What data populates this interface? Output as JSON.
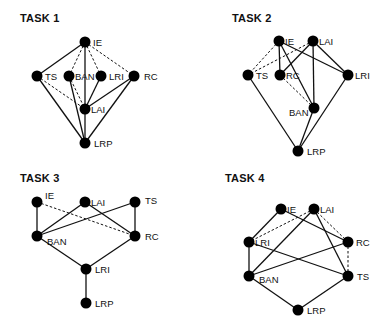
{
  "panels": [
    {
      "title": "TASK 1",
      "title_pos": [
        20,
        18
      ],
      "nodes": [
        {
          "id": "IE",
          "x": 85,
          "y": 42,
          "label": "IE",
          "lx": 8,
          "ly": 4
        },
        {
          "id": "TS",
          "x": 37,
          "y": 76,
          "label": "TS",
          "lx": 8,
          "ly": 4
        },
        {
          "id": "BAN",
          "x": 69,
          "y": 76,
          "label": "BAN",
          "lx": 6,
          "ly": 4
        },
        {
          "id": "LRI",
          "x": 101,
          "y": 76,
          "label": "LRI",
          "lx": 8,
          "ly": 4
        },
        {
          "id": "RC",
          "x": 134,
          "y": 76,
          "label": "RC",
          "lx": 10,
          "ly": 4
        },
        {
          "id": "LAI",
          "x": 85,
          "y": 109,
          "label": "LAI",
          "lx": 6,
          "ly": 4
        },
        {
          "id": "LRP",
          "x": 85,
          "y": 143,
          "label": "LRP",
          "lx": 9,
          "ly": 4
        }
      ],
      "edges": [
        {
          "from": "IE",
          "to": "TS",
          "style": "solid"
        },
        {
          "from": "IE",
          "to": "BAN",
          "style": "dashed"
        },
        {
          "from": "IE",
          "to": "LRI",
          "style": "dashed"
        },
        {
          "from": "IE",
          "to": "RC",
          "style": "dashed"
        },
        {
          "from": "IE",
          "to": "LAI",
          "style": "solid"
        },
        {
          "from": "TS",
          "to": "LAI",
          "style": "dashed"
        },
        {
          "from": "TS",
          "to": "LRP",
          "style": "solid"
        },
        {
          "from": "BAN",
          "to": "LAI",
          "style": "dashed"
        },
        {
          "from": "BAN",
          "to": "LRP",
          "style": "solid"
        },
        {
          "from": "LRI",
          "to": "LAI",
          "style": "solid"
        },
        {
          "from": "RC",
          "to": "LAI",
          "style": "solid"
        },
        {
          "from": "RC",
          "to": "LRP",
          "style": "solid"
        },
        {
          "from": "LAI",
          "to": "LRP",
          "style": "solid"
        }
      ]
    },
    {
      "title": "TASK 2",
      "title_pos": [
        232,
        18
      ],
      "nodes": [
        {
          "id": "IE",
          "x": 279,
          "y": 41,
          "label": "IE",
          "lx": 6,
          "ly": 4
        },
        {
          "id": "LAI",
          "x": 313,
          "y": 41,
          "label": "LAI",
          "lx": 6,
          "ly": 4
        },
        {
          "id": "TS",
          "x": 248,
          "y": 75,
          "label": "TS",
          "lx": 8,
          "ly": 4
        },
        {
          "id": "RC",
          "x": 280,
          "y": 75,
          "label": "RC",
          "lx": 6,
          "ly": 4
        },
        {
          "id": "LRI",
          "x": 348,
          "y": 75,
          "label": "LRI",
          "lx": 7,
          "ly": 4
        },
        {
          "id": "BAN",
          "x": 314,
          "y": 108,
          "label": "BAN",
          "lx": -25,
          "ly": 8
        },
        {
          "id": "LRP",
          "x": 298,
          "y": 151,
          "label": "LRP",
          "lx": 9,
          "ly": 4
        }
      ],
      "edges": [
        {
          "from": "IE",
          "to": "TS",
          "style": "dashed"
        },
        {
          "from": "LAI",
          "to": "TS",
          "style": "dashed"
        },
        {
          "from": "IE",
          "to": "RC",
          "style": "solid"
        },
        {
          "from": "IE",
          "to": "BAN",
          "style": "solid"
        },
        {
          "from": "IE",
          "to": "LRI",
          "style": "solid"
        },
        {
          "from": "LAI",
          "to": "RC",
          "style": "solid"
        },
        {
          "from": "LAI",
          "to": "LRI",
          "style": "solid"
        },
        {
          "from": "LAI",
          "to": "BAN",
          "style": "solid"
        },
        {
          "from": "RC",
          "to": "BAN",
          "style": "dashed"
        },
        {
          "from": "TS",
          "to": "LRP",
          "style": "solid"
        },
        {
          "from": "BAN",
          "to": "LRP",
          "style": "solid"
        },
        {
          "from": "LRI",
          "to": "LRP",
          "style": "solid"
        }
      ]
    },
    {
      "title": "TASK 3",
      "title_pos": [
        20,
        178
      ],
      "nodes": [
        {
          "id": "IE",
          "x": 37,
          "y": 202,
          "label": "IE",
          "lx": 8,
          "ly": -3
        },
        {
          "id": "LAI",
          "x": 85,
          "y": 202,
          "label": "LAI",
          "lx": 6,
          "ly": 4
        },
        {
          "id": "TS",
          "x": 135,
          "y": 202,
          "label": "TS",
          "lx": 10,
          "ly": 2
        },
        {
          "id": "BAN",
          "x": 37,
          "y": 236,
          "label": "BAN",
          "lx": 10,
          "ly": 9
        },
        {
          "id": "RC",
          "x": 135,
          "y": 236,
          "label": "RC",
          "lx": 10,
          "ly": 4
        },
        {
          "id": "LRI",
          "x": 86,
          "y": 269,
          "label": "LRI",
          "lx": 9,
          "ly": 4
        },
        {
          "id": "LRP",
          "x": 86,
          "y": 303,
          "label": "LRP",
          "lx": 9,
          "ly": 4
        }
      ],
      "edges": [
        {
          "from": "IE",
          "to": "BAN",
          "style": "solid"
        },
        {
          "from": "IE",
          "to": "RC",
          "style": "dashed"
        },
        {
          "from": "LAI",
          "to": "BAN",
          "style": "solid"
        },
        {
          "from": "LAI",
          "to": "RC",
          "style": "solid"
        },
        {
          "from": "TS",
          "to": "BAN",
          "style": "solid"
        },
        {
          "from": "TS",
          "to": "RC",
          "style": "solid"
        },
        {
          "from": "BAN",
          "to": "LRI",
          "style": "solid"
        },
        {
          "from": "RC",
          "to": "LRI",
          "style": "solid"
        },
        {
          "from": "LRI",
          "to": "LRP",
          "style": "solid"
        }
      ]
    },
    {
      "title": "TASK 4",
      "title_pos": [
        225,
        178
      ],
      "nodes": [
        {
          "id": "IE",
          "x": 281,
          "y": 209,
          "label": "IE",
          "lx": 6,
          "ly": 4
        },
        {
          "id": "LAI",
          "x": 314,
          "y": 209,
          "label": "LAI",
          "lx": 6,
          "ly": 4
        },
        {
          "id": "LRI",
          "x": 249,
          "y": 242,
          "label": "LRI",
          "lx": 6,
          "ly": 4
        },
        {
          "id": "RC",
          "x": 348,
          "y": 242,
          "label": "RC",
          "lx": 8,
          "ly": 4
        },
        {
          "id": "BAN",
          "x": 249,
          "y": 276,
          "label": "BAN",
          "lx": 10,
          "ly": 7
        },
        {
          "id": "TS",
          "x": 348,
          "y": 276,
          "label": "TS",
          "lx": 9,
          "ly": 4
        },
        {
          "id": "LRP",
          "x": 298,
          "y": 310,
          "label": "LRP",
          "lx": 9,
          "ly": 4
        }
      ],
      "edges": [
        {
          "from": "IE",
          "to": "LRI",
          "style": "solid"
        },
        {
          "from": "IE",
          "to": "RC",
          "style": "solid"
        },
        {
          "from": "LAI",
          "to": "LRI",
          "style": "dashed"
        },
        {
          "from": "LAI",
          "to": "RC",
          "style": "dashed"
        },
        {
          "from": "LAI",
          "to": "BAN",
          "style": "solid"
        },
        {
          "from": "LAI",
          "to": "TS",
          "style": "solid"
        },
        {
          "from": "RC",
          "to": "TS",
          "style": "dashed"
        },
        {
          "from": "RC",
          "to": "BAN",
          "style": "solid"
        },
        {
          "from": "LRI",
          "to": "TS",
          "style": "solid"
        },
        {
          "from": "LRI",
          "to": "BAN",
          "style": "solid"
        },
        {
          "from": "BAN",
          "to": "LRP",
          "style": "solid"
        },
        {
          "from": "TS",
          "to": "LRP",
          "style": "solid"
        }
      ]
    }
  ],
  "style": {
    "node_color": "#000000",
    "edge_color": "#111111",
    "node_radius": 5.5
  }
}
